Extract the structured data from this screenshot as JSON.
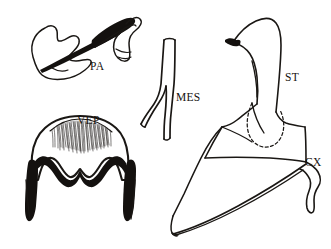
{
  "figure": {
    "title": "",
    "background_color": "#ffffff",
    "ink_color": "#1a1714",
    "type": "scientific-line-drawing",
    "labels": [
      {
        "id": "PA",
        "text": "PA",
        "x": 90,
        "y": 70,
        "structure": "paramere"
      },
      {
        "id": "VEP",
        "text": "VEP",
        "x": 77,
        "y": 124,
        "structure": "ventral-epandrial-plate"
      },
      {
        "id": "MES",
        "text": "MES",
        "x": 176,
        "y": 101,
        "structure": "mesofurca"
      },
      {
        "id": "ST",
        "text": "ST",
        "x": 285,
        "y": 81,
        "structure": "sternite"
      },
      {
        "id": "CX",
        "text": "CX",
        "x": 305,
        "y": 166,
        "structure": "coxa"
      }
    ],
    "structures": [
      {
        "id": "pa-structure",
        "name": "paramere",
        "label": "PA",
        "position": "top-left",
        "description": "irregular blob outline crossed by a dark tapering spine, with an elongated dark loop and hooked curl at the right"
      },
      {
        "id": "vep-structure",
        "name": "ventral-epandrial-plate",
        "label": "VEP",
        "position": "bottom-left",
        "description": "rounded shield outline with dense bristle fringe along the upper arc and a thick black scalloped lower border with a central notch"
      },
      {
        "id": "mes-structure",
        "name": "mesofurca",
        "label": "MES",
        "position": "center",
        "description": "narrow Y-shaped stem splitting into two diverging arms at the base"
      },
      {
        "id": "st-structure",
        "name": "sternite",
        "label": "ST",
        "position": "top-right",
        "description": "beak-shaped apex with small dark eye spot above a broad plate with dashed internal lobe"
      },
      {
        "id": "cx-structure",
        "name": "coxa",
        "label": "CX",
        "position": "bottom-right",
        "description": "large wedge-shaped body with pointed left tip and a small hook-like projection at the right margin"
      }
    ]
  }
}
